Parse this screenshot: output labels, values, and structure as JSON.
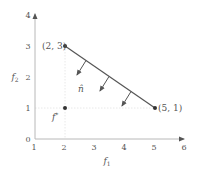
{
  "diagram": {
    "type": "objective-space plot",
    "x_axis": {
      "label_base": "f",
      "label_sub": "1",
      "ticks": [
        "1",
        "2",
        "3",
        "4",
        "5",
        "6"
      ]
    },
    "y_axis": {
      "label_base": "f",
      "label_sub": "2",
      "ticks": [
        "0",
        "1",
        "2",
        "3",
        "4"
      ]
    },
    "points": [
      {
        "id": "p1",
        "label": "(2, 3)",
        "x": 2,
        "y": 3
      },
      {
        "id": "p2",
        "label": "(5, 1)",
        "x": 5,
        "y": 1
      },
      {
        "id": "ideal",
        "label_base": "f",
        "label_sup": "*",
        "x": 2,
        "y": 1
      }
    ],
    "segment": {
      "from": "(2, 3)",
      "to": "(5, 1)"
    },
    "normal_label": "n̂",
    "normal_arrow_count": 3,
    "colors": {
      "line": "#555555",
      "axis": "#b8b8b8",
      "grid": "#e2e2e2",
      "text": "#555555"
    }
  }
}
